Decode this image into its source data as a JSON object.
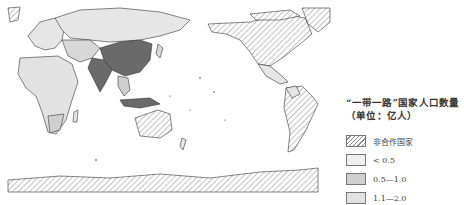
{
  "map": {
    "projection": "Pacific-centered world map",
    "style": "grayscale choropleth",
    "regions": [
      {
        "name": "China",
        "class": "gt2"
      },
      {
        "name": "India",
        "class": "gt2"
      },
      {
        "name": "Russia",
        "class": "lt05"
      },
      {
        "name": "Indonesia",
        "class": "gt2"
      },
      {
        "name": "North America",
        "class": "non"
      },
      {
        "name": "South America",
        "class": "non"
      },
      {
        "name": "Australia",
        "class": "non"
      },
      {
        "name": "Antarctica",
        "class": "non"
      },
      {
        "name": "Greenland",
        "class": "non"
      },
      {
        "name": "Africa",
        "class": "mixed"
      },
      {
        "name": "Europe",
        "class": "mixed"
      }
    ]
  },
  "legend": {
    "title_line1": "“一带一路”国家人口数量",
    "title_line2": "（单位：亿人）",
    "items": [
      {
        "label": "非合作国家",
        "pattern": "hatch",
        "color": "#ffffff"
      },
      {
        "label": "< 0.5",
        "pattern": "solid",
        "color": "#eeeeee"
      },
      {
        "label": "0.5—1.0",
        "pattern": "solid",
        "color": "#cfcfcf"
      },
      {
        "label": "1.1—2.0",
        "pattern": "solid",
        "color": "#e2e2e2"
      },
      {
        "label": "> 2.0",
        "pattern": "solid",
        "color": "#6a6a6a"
      }
    ]
  },
  "colors": {
    "border": "#333333",
    "hatch_line": "#888888",
    "background": "#ffffff"
  }
}
